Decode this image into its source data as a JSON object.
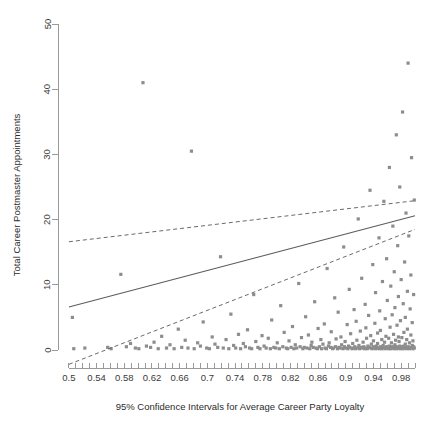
{
  "chart_data": {
    "type": "scatter",
    "title": "",
    "xlabel": "95% Confidence Intervals for Average Career Party Loyalty",
    "ylabel": "Total Career Postmaster Appointments",
    "xlim": [
      0.49,
      1.0
    ],
    "ylim": [
      -1.5,
      51
    ],
    "grid": false,
    "legend": "none",
    "x_ticks_major": [
      0.5,
      0.54,
      0.58,
      0.62,
      0.66,
      0.7,
      0.74,
      0.78,
      0.82,
      0.86,
      0.9,
      0.94,
      0.98
    ],
    "x_tick_labels": [
      "0.5",
      "0.54",
      "0.58",
      "0.62",
      "0.66",
      "0.7",
      "0.74",
      "0.78",
      "0.82",
      "0.86",
      "0.9",
      "0.94",
      "0.98"
    ],
    "x_minor_tick_step": 0.01,
    "y_ticks": [
      0,
      10,
      20,
      30,
      40,
      50
    ],
    "y_tick_labels": [
      "0",
      "10",
      "20",
      "30",
      "40",
      "50"
    ],
    "series": [
      {
        "name": "fit-line",
        "style": "solid",
        "color": "#5c5c5c",
        "points": [
          [
            0.5,
            6.6
          ],
          [
            1.0,
            20.6
          ]
        ]
      },
      {
        "name": "upper-confidence-band",
        "style": "dashed",
        "color": "#6a6a6a",
        "points": [
          [
            0.5,
            16.6
          ],
          [
            1.0,
            22.9
          ]
        ]
      },
      {
        "name": "lower-confidence-band",
        "style": "dashed",
        "color": "#6a6a6a",
        "points": [
          [
            0.5,
            -2.2
          ],
          [
            1.0,
            18.5
          ]
        ]
      }
    ],
    "scatter": {
      "name": "observations",
      "color": "#8d8d8d",
      "marker": "square",
      "marker_size": 1.6,
      "x": [
        0.505,
        0.507,
        0.523,
        0.556,
        0.561,
        0.575,
        0.583,
        0.589,
        0.596,
        0.601,
        0.607,
        0.612,
        0.618,
        0.623,
        0.629,
        0.634,
        0.641,
        0.646,
        0.652,
        0.658,
        0.663,
        0.668,
        0.672,
        0.677,
        0.681,
        0.686,
        0.69,
        0.694,
        0.699,
        0.703,
        0.707,
        0.711,
        0.715,
        0.719,
        0.723,
        0.727,
        0.731,
        0.734,
        0.738,
        0.741,
        0.745,
        0.748,
        0.752,
        0.755,
        0.758,
        0.761,
        0.764,
        0.767,
        0.77,
        0.773,
        0.776,
        0.779,
        0.782,
        0.785,
        0.788,
        0.791,
        0.793,
        0.796,
        0.799,
        0.801,
        0.804,
        0.806,
        0.809,
        0.811,
        0.814,
        0.816,
        0.818,
        0.821,
        0.823,
        0.825,
        0.827,
        0.829,
        0.832,
        0.834,
        0.836,
        0.838,
        0.84,
        0.842,
        0.844,
        0.846,
        0.848,
        0.85,
        0.851,
        0.853,
        0.855,
        0.857,
        0.859,
        0.86,
        0.862,
        0.864,
        0.865,
        0.867,
        0.869,
        0.87,
        0.872,
        0.873,
        0.875,
        0.876,
        0.878,
        0.879,
        0.881,
        0.882,
        0.884,
        0.885,
        0.886,
        0.888,
        0.889,
        0.89,
        0.892,
        0.893,
        0.894,
        0.896,
        0.897,
        0.898,
        0.899,
        0.9,
        0.902,
        0.903,
        0.904,
        0.905,
        0.906,
        0.907,
        0.909,
        0.91,
        0.911,
        0.912,
        0.913,
        0.914,
        0.915,
        0.916,
        0.917,
        0.918,
        0.919,
        0.92,
        0.921,
        0.922,
        0.923,
        0.924,
        0.925,
        0.926,
        0.927,
        0.928,
        0.929,
        0.93,
        0.93,
        0.931,
        0.932,
        0.933,
        0.934,
        0.935,
        0.936,
        0.936,
        0.937,
        0.938,
        0.939,
        0.94,
        0.94,
        0.941,
        0.942,
        0.943,
        0.943,
        0.944,
        0.945,
        0.946,
        0.946,
        0.947,
        0.948,
        0.948,
        0.949,
        0.95,
        0.95,
        0.951,
        0.952,
        0.952,
        0.953,
        0.954,
        0.954,
        0.955,
        0.956,
        0.956,
        0.957,
        0.957,
        0.958,
        0.959,
        0.959,
        0.96,
        0.96,
        0.961,
        0.962,
        0.962,
        0.963,
        0.963,
        0.964,
        0.964,
        0.965,
        0.965,
        0.966,
        0.967,
        0.967,
        0.968,
        0.968,
        0.969,
        0.969,
        0.97,
        0.97,
        0.971,
        0.971,
        0.972,
        0.972,
        0.973,
        0.973,
        0.974,
        0.974,
        0.975,
        0.975,
        0.976,
        0.976,
        0.977,
        0.977,
        0.978,
        0.978,
        0.979,
        0.979,
        0.98,
        0.98,
        0.981,
        0.981,
        0.982,
        0.982,
        0.983,
        0.983,
        0.984,
        0.984,
        0.985,
        0.985,
        0.986,
        0.986,
        0.987,
        0.987,
        0.988,
        0.988,
        0.989,
        0.989,
        0.99,
        0.99,
        0.991,
        0.991,
        0.992,
        0.992,
        0.993,
        0.993,
        0.994,
        0.994,
        0.995,
        0.995,
        0.996,
        0.996,
        0.997,
        0.997,
        0.998,
        0.998,
        0.999,
        0.999
      ],
      "y": [
        5.0,
        0.2,
        0.3,
        0.4,
        0.2,
        11.6,
        0.5,
        1.0,
        0.3,
        0.2,
        41.0,
        0.6,
        0.4,
        1.2,
        0.2,
        2.1,
        0.3,
        0.8,
        0.2,
        3.2,
        0.4,
        1.5,
        0.3,
        30.5,
        0.2,
        1.1,
        0.6,
        4.3,
        0.3,
        0.2,
        2.0,
        0.9,
        0.4,
        14.3,
        0.3,
        1.6,
        0.2,
        5.5,
        0.7,
        0.3,
        2.4,
        0.2,
        1.0,
        0.5,
        3.1,
        0.3,
        0.2,
        8.5,
        1.3,
        0.4,
        0.2,
        2.2,
        0.6,
        0.3,
        1.8,
        0.2,
        4.6,
        0.4,
        0.3,
        1.1,
        0.2,
        6.8,
        0.5,
        2.7,
        0.3,
        0.2,
        1.4,
        0.4,
        3.6,
        0.2,
        0.8,
        0.3,
        10.2,
        0.5,
        1.9,
        0.2,
        0.4,
        5.1,
        0.3,
        2.3,
        0.2,
        0.7,
        1.2,
        0.4,
        7.4,
        0.3,
        0.2,
        3.3,
        0.5,
        1.6,
        0.2,
        0.9,
        4.0,
        0.3,
        0.2,
        12.5,
        0.6,
        1.1,
        0.4,
        2.8,
        0.2,
        0.3,
        8.0,
        0.5,
        1.7,
        0.2,
        5.8,
        0.4,
        0.3,
        2.0,
        0.8,
        0.2,
        15.8,
        0.5,
        1.3,
        0.3,
        3.9,
        0.2,
        0.6,
        9.3,
        0.4,
        2.5,
        0.2,
        1.0,
        0.3,
        6.2,
        0.5,
        0.2,
        4.4,
        1.5,
        0.3,
        20.1,
        0.7,
        0.2,
        2.9,
        0.4,
        11.0,
        0.3,
        1.2,
        0.5,
        0.2,
        7.0,
        3.4,
        0.3,
        1.8,
        0.2,
        0.6,
        5.3,
        0.4,
        24.5,
        0.3,
        2.2,
        0.9,
        0.2,
        13.1,
        0.5,
        1.4,
        0.3,
        4.1,
        0.2,
        8.8,
        0.6,
        0.4,
        2.6,
        1.0,
        0.3,
        17.2,
        0.2,
        6.0,
        0.5,
        3.0,
        0.3,
        1.6,
        0.2,
        10.5,
        0.4,
        0.7,
        22.8,
        1.2,
        0.3,
        4.8,
        0.2,
        2.1,
        0.5,
        14.0,
        0.3,
        7.6,
        0.4,
        1.8,
        0.2,
        28.0,
        0.6,
        3.5,
        0.3,
        9.8,
        0.2,
        1.1,
        0.5,
        5.4,
        19.0,
        0.3,
        2.4,
        0.4,
        12.0,
        0.2,
        0.8,
        6.5,
        1.5,
        0.3,
        33.0,
        0.5,
        3.8,
        0.2,
        16.0,
        0.4,
        2.0,
        8.2,
        0.3,
        1.3,
        0.6,
        25.0,
        0.2,
        4.5,
        0.5,
        10.8,
        0.3,
        1.9,
        0.4,
        36.5,
        7.1,
        0.2,
        2.7,
        0.6,
        13.5,
        0.3,
        0.9,
        5.0,
        21.0,
        0.4,
        1.6,
        0.2,
        9.0,
        3.2,
        0.5,
        44.0,
        0.3,
        17.5,
        1.1,
        0.2,
        6.3,
        0.4,
        2.3,
        11.5,
        0.3,
        29.5,
        0.7,
        4.2,
        0.2,
        1.4,
        8.5,
        0.5,
        23.0,
        0.3,
        38.0,
        2.8,
        0.4,
        15.0,
        1.0,
        0.2,
        5.7,
        47.5,
        0.3,
        19.5,
        3.6,
        0.6,
        10.0,
        0.2,
        26.5,
        1.7,
        0.4,
        41.5,
        7.8,
        0.3,
        13.0,
        2.2,
        0.5,
        31.0,
        49.0,
        0.2
      ]
    }
  },
  "axis": {
    "x_title": "95% Confidence Intervals for Average Career Party Loyalty",
    "y_title": "Total Career Postmaster Appointments"
  },
  "colors": {
    "axis": "#9a9a9a",
    "point": "#8d8d8d",
    "fit": "#5c5c5c",
    "ci": "#6a6a6a",
    "text": "#2b2b2b",
    "background": "#ffffff"
  }
}
